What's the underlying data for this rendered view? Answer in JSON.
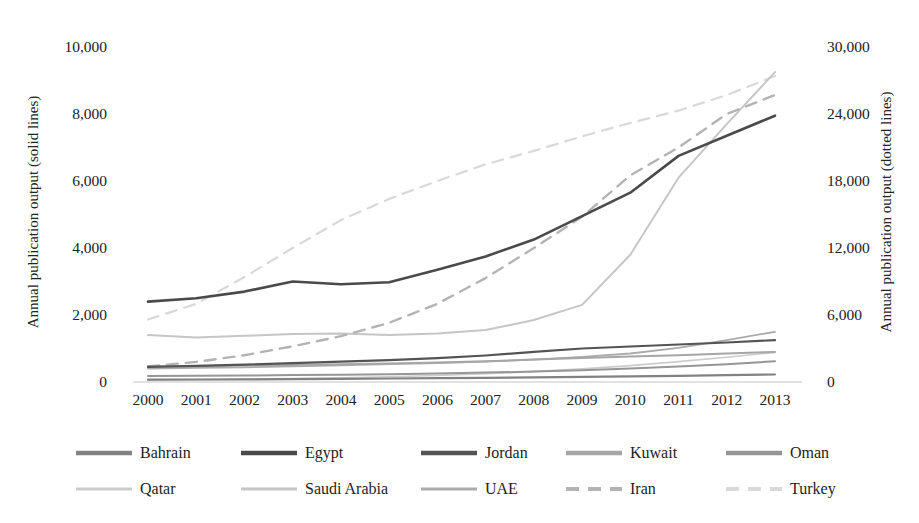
{
  "figure": {
    "background": "#ffffff",
    "axis_line_color": "#c4c4c4"
  },
  "chart_data": {
    "type": "line",
    "title": "",
    "xlabel": "",
    "ylabel_left": "Annual publication output (solid lines)",
    "ylabel_right": "Annual publication output (dotted lines)",
    "grid": false,
    "legend_position": "bottom",
    "x": [
      2000,
      2001,
      2002,
      2003,
      2004,
      2005,
      2006,
      2007,
      2008,
      2009,
      2010,
      2011,
      2012,
      2013
    ],
    "x_tick_labels": [
      "2000",
      "2001",
      "2002",
      "2003",
      "2004",
      "2005",
      "2006",
      "2007",
      "2008",
      "2009",
      "2010",
      "2011",
      "2012",
      "2013"
    ],
    "axes": {
      "left": {
        "min": 0,
        "max": 10000,
        "ticks": [
          {
            "label": "10,000",
            "value": 10000
          },
          {
            "label": "8,000",
            "value": 8000
          },
          {
            "label": "6,000",
            "value": 6000
          },
          {
            "label": "4,000",
            "value": 4000
          },
          {
            "label": "2,000",
            "value": 2000
          },
          {
            "label": "0",
            "value": 0
          }
        ]
      },
      "right": {
        "min": 0,
        "max": 30000,
        "ticks": [
          {
            "label": "30,000",
            "value": 30000
          },
          {
            "label": "24,000",
            "value": 24000
          },
          {
            "label": "18,000",
            "value": 18000
          },
          {
            "label": "12,000",
            "value": 12000
          },
          {
            "label": "6,000",
            "value": 6000
          },
          {
            "label": "0",
            "value": 0
          }
        ]
      }
    },
    "series": [
      {
        "name": "Bahrain",
        "axis": "left",
        "style": "solid",
        "color": "#828282",
        "width": 2.2,
        "values": [
          70,
          75,
          80,
          85,
          95,
          105,
          115,
          125,
          140,
          155,
          170,
          185,
          205,
          225
        ]
      },
      {
        "name": "Egypt",
        "axis": "left",
        "style": "solid",
        "color": "#4a4a4a",
        "width": 2.6,
        "values": [
          2400,
          2500,
          2700,
          3000,
          2920,
          2980,
          3350,
          3750,
          4250,
          4950,
          5650,
          6750,
          7350,
          7950
        ]
      },
      {
        "name": "Jordan",
        "axis": "left",
        "style": "solid",
        "color": "#545454",
        "width": 2.2,
        "values": [
          450,
          480,
          520,
          560,
          610,
          650,
          710,
          790,
          900,
          1000,
          1060,
          1120,
          1180,
          1250
        ]
      },
      {
        "name": "Kuwait",
        "axis": "left",
        "style": "solid",
        "color": "#a6a6a6",
        "width": 2.0,
        "values": [
          460,
          470,
          490,
          510,
          530,
          550,
          580,
          620,
          670,
          720,
          760,
          800,
          850,
          900
        ]
      },
      {
        "name": "Oman",
        "axis": "left",
        "style": "solid",
        "color": "#969696",
        "width": 2.0,
        "values": [
          180,
          185,
          195,
          205,
          215,
          230,
          250,
          280,
          310,
          350,
          400,
          460,
          530,
          620
        ]
      },
      {
        "name": "Qatar",
        "axis": "left",
        "style": "solid",
        "color": "#cccccc",
        "width": 1.6,
        "values": [
          60,
          70,
          85,
          100,
          125,
          155,
          195,
          245,
          310,
          390,
          490,
          610,
          740,
          880
        ]
      },
      {
        "name": "Saudi Arabia",
        "axis": "left",
        "style": "solid",
        "color": "#c6c6c6",
        "width": 2.0,
        "values": [
          1400,
          1330,
          1380,
          1430,
          1450,
          1400,
          1450,
          1550,
          1850,
          2300,
          3800,
          6100,
          7700,
          9250
        ]
      },
      {
        "name": "UAE",
        "axis": "left",
        "style": "solid",
        "color": "#ababab",
        "width": 1.8,
        "values": [
          400,
          420,
          440,
          470,
          500,
          530,
          560,
          610,
          670,
          750,
          850,
          1020,
          1250,
          1500
        ]
      },
      {
        "name": "Iran",
        "axis": "right",
        "style": "dashed",
        "color": "#b3b3b3",
        "width": 2.4,
        "values": [
          1400,
          1800,
          2400,
          3200,
          4100,
          5300,
          7000,
          9300,
          12000,
          14800,
          18500,
          21000,
          24000,
          25700
        ]
      },
      {
        "name": "Turkey",
        "axis": "right",
        "style": "dashed",
        "color": "#d9d9d9",
        "width": 2.2,
        "values": [
          5600,
          7000,
          9400,
          12000,
          14500,
          16400,
          18000,
          19500,
          20700,
          22000,
          23200,
          24300,
          25700,
          27400
        ]
      }
    ]
  }
}
